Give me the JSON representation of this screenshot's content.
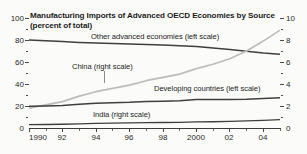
{
  "header": {
    "title": "Manufacturing Imports of Advanced OECD Economies by Source",
    "subtitle": "(percent of total)"
  },
  "annotations": {
    "other_advanced": "Other advanced economies (left scale)",
    "china": "China (right scale)",
    "developing": "Developing countries (left scale)",
    "india": "India (right scale)"
  },
  "colors": {
    "dark_line": "#3f3f3f",
    "light_line": "#bcbcbc",
    "axis": "#3c3c3c",
    "text": "#1b1b1b",
    "background": "#fbfbf9"
  },
  "axes": {
    "left": {
      "ticks": [
        "0",
        "20",
        "40",
        "60",
        "80",
        "100"
      ],
      "min": 0,
      "max": 100,
      "minor_step": 10
    },
    "right": {
      "ticks": [
        "0",
        "2",
        "4",
        "6",
        "8",
        "10"
      ],
      "min": 0,
      "max": 10,
      "minor_step": 1
    },
    "x": {
      "ticks": [
        "1990",
        "92",
        "94",
        "96",
        "98",
        "2000",
        "02",
        "04"
      ],
      "min": 1990,
      "max": 2005
    }
  },
  "chart_data": {
    "type": "line",
    "title": "Manufacturing Imports of Advanced OECD Economies by Source",
    "subtitle": "(percent of total)",
    "xlabel": "",
    "ylabel": "percent of total",
    "y2label": "percent of total",
    "ylim": [
      0,
      100
    ],
    "y2lim": [
      0,
      10
    ],
    "xlim": [
      1990,
      2005
    ],
    "grid": false,
    "legend": "inline-annotations",
    "x": [
      1990,
      1991,
      1992,
      1993,
      1994,
      1995,
      1996,
      1997,
      1998,
      1999,
      2000,
      2001,
      2002,
      2003,
      2004,
      2005
    ],
    "series": [
      {
        "name": "Other advanced economies (left scale)",
        "axis": "left",
        "color": "#3f3f3f",
        "values": [
          80.0,
          79.4,
          78.6,
          77.8,
          77.2,
          76.8,
          76.4,
          75.8,
          75.4,
          74.8,
          74.0,
          72.8,
          71.4,
          69.8,
          68.2,
          67.0
        ]
      },
      {
        "name": "China (right scale)",
        "axis": "right",
        "color": "#bcbcbc",
        "values": [
          1.8,
          2.1,
          2.4,
          2.9,
          3.3,
          3.6,
          3.9,
          4.3,
          4.6,
          4.9,
          5.4,
          5.8,
          6.3,
          7.0,
          7.9,
          8.9
        ]
      },
      {
        "name": "Developing countries (left scale)",
        "axis": "left",
        "color": "#3f3f3f",
        "values": [
          19.8,
          20.0,
          20.4,
          21.6,
          22.5,
          23.0,
          23.4,
          24.2,
          24.4,
          24.8,
          25.8,
          26.0,
          25.8,
          26.1,
          26.8,
          27.4
        ]
      },
      {
        "name": "India (right scale)",
        "axis": "right",
        "color": "#3f3f3f",
        "values": [
          0.3,
          0.32,
          0.34,
          0.38,
          0.42,
          0.44,
          0.46,
          0.48,
          0.5,
          0.52,
          0.55,
          0.57,
          0.6,
          0.64,
          0.7,
          0.76
        ]
      }
    ]
  }
}
